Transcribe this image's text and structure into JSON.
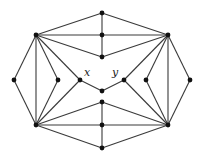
{
  "graph": {
    "nodes": [
      {
        "id": "top",
        "label": ""
      },
      {
        "id": "top_mid",
        "label": ""
      },
      {
        "id": "top_inner",
        "label": ""
      },
      {
        "id": "ul",
        "label": ""
      },
      {
        "id": "ur",
        "label": ""
      },
      {
        "id": "far_left",
        "label": ""
      },
      {
        "id": "left_inner",
        "label": ""
      },
      {
        "id": "x",
        "label": "x"
      },
      {
        "id": "center",
        "label": ""
      },
      {
        "id": "y",
        "label": "y"
      },
      {
        "id": "right_inner",
        "label": ""
      },
      {
        "id": "far_right",
        "label": ""
      },
      {
        "id": "bottom_inner",
        "label": ""
      },
      {
        "id": "bottom_mid",
        "label": ""
      },
      {
        "id": "bottom",
        "label": ""
      },
      {
        "id": "ll",
        "label": ""
      },
      {
        "id": "lr",
        "label": ""
      }
    ],
    "edges": [
      [
        "top",
        "top_mid"
      ],
      [
        "top_mid",
        "top_inner"
      ],
      [
        "ul",
        "top"
      ],
      [
        "ul",
        "top_mid"
      ],
      [
        "ul",
        "top_inner"
      ],
      [
        "ur",
        "top"
      ],
      [
        "ur",
        "top_mid"
      ],
      [
        "ur",
        "top_inner"
      ],
      [
        "ul",
        "far_left"
      ],
      [
        "ul",
        "ll"
      ],
      [
        "ul",
        "left_inner"
      ],
      [
        "ul",
        "x"
      ],
      [
        "ur",
        "far_right"
      ],
      [
        "ur",
        "lr"
      ],
      [
        "ur",
        "right_inner"
      ],
      [
        "ur",
        "y"
      ],
      [
        "ll",
        "far_left"
      ],
      [
        "ll",
        "left_inner"
      ],
      [
        "ll",
        "x"
      ],
      [
        "lr",
        "far_right"
      ],
      [
        "lr",
        "right_inner"
      ],
      [
        "lr",
        "y"
      ],
      [
        "x",
        "center"
      ],
      [
        "center",
        "y"
      ],
      [
        "bottom_inner",
        "bottom_mid"
      ],
      [
        "bottom_mid",
        "bottom"
      ],
      [
        "ll",
        "bottom_inner"
      ],
      [
        "ll",
        "bottom_mid"
      ],
      [
        "ll",
        "bottom"
      ],
      [
        "lr",
        "bottom_inner"
      ],
      [
        "lr",
        "bottom_mid"
      ],
      [
        "lr",
        "bottom"
      ]
    ],
    "labels": {
      "x": "x",
      "y": "y"
    }
  }
}
